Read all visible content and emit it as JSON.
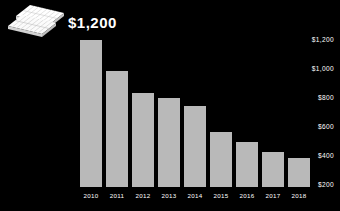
{
  "background_color": "#000000",
  "headline": "$1,200",
  "icon": {
    "name": "solar-panel-icon",
    "color": "#f2f2f2"
  },
  "chart_data": {
    "type": "bar",
    "title": "$1,200",
    "xlabel": "",
    "ylabel": "",
    "categories": [
      "2010",
      "2011",
      "2012",
      "2013",
      "2014",
      "2015",
      "2016",
      "2017",
      "2018"
    ],
    "values": [
      1200,
      945,
      765,
      725,
      660,
      450,
      370,
      285,
      240
    ],
    "ylim": [
      0,
      1280
    ],
    "ytick_labels": [
      "$1,200",
      "$1,000",
      "$800",
      "$600",
      "$400",
      "$200"
    ],
    "ytick_values": [
      1200,
      1000,
      800,
      600,
      400,
      200
    ],
    "bar_color": "#b9b9b9",
    "text_color": "#ffffff",
    "grid": false,
    "legend": null,
    "legend_position": "none"
  }
}
